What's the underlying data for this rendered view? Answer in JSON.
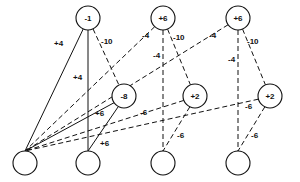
{
  "diagram": {
    "type": "neural-network",
    "nodes": [
      {
        "id": "o1",
        "layer": "output",
        "label": "-1",
        "x": 88,
        "y": 18
      },
      {
        "id": "o2",
        "layer": "output",
        "label": "+6",
        "x": 163,
        "y": 18
      },
      {
        "id": "o3",
        "layer": "output",
        "label": "+6",
        "x": 238,
        "y": 18
      },
      {
        "id": "h1",
        "layer": "hidden",
        "label": "-8",
        "x": 124,
        "y": 96
      },
      {
        "id": "h2",
        "layer": "hidden",
        "label": "+2",
        "x": 195,
        "y": 96
      },
      {
        "id": "h3",
        "layer": "hidden",
        "label": "+2",
        "x": 270,
        "y": 96
      },
      {
        "id": "i1",
        "layer": "input",
        "label": "",
        "x": 25,
        "y": 163
      },
      {
        "id": "i2",
        "layer": "input",
        "label": "",
        "x": 88,
        "y": 163
      },
      {
        "id": "i3",
        "layer": "input",
        "label": "",
        "x": 163,
        "y": 163
      },
      {
        "id": "i4",
        "layer": "input",
        "label": "",
        "x": 238,
        "y": 163
      }
    ],
    "edges": [
      {
        "from": "o1",
        "to": "i1",
        "weight": "+4",
        "style": "solid",
        "lx": 54,
        "ly": 46
      },
      {
        "from": "o1",
        "to": "i2",
        "weight": "+4",
        "style": "solid",
        "lx": 73,
        "ly": 80
      },
      {
        "from": "o1",
        "to": "h1",
        "weight": "-10",
        "style": "dashed",
        "lx": 101,
        "ly": 44
      },
      {
        "from": "o2",
        "to": "i1",
        "weight": "-4",
        "style": "dashed",
        "lx": 142,
        "ly": 38
      },
      {
        "from": "o2",
        "to": "i3",
        "weight": "-4",
        "style": "dashed",
        "lx": 153,
        "ly": 58
      },
      {
        "from": "o2",
        "to": "h2",
        "weight": "-10",
        "style": "dashed",
        "lx": 173,
        "ly": 40
      },
      {
        "from": "o3",
        "to": "i1",
        "weight": "-4",
        "style": "dashed",
        "lx": 209,
        "ly": 38
      },
      {
        "from": "o3",
        "to": "i4",
        "weight": "-4",
        "style": "dashed",
        "lx": 228,
        "ly": 62
      },
      {
        "from": "o3",
        "to": "h3",
        "weight": "-10",
        "style": "dashed",
        "lx": 247,
        "ly": 44
      },
      {
        "from": "h1",
        "to": "i1",
        "weight": "+6",
        "style": "solid",
        "lx": 95,
        "ly": 116
      },
      {
        "from": "h1",
        "to": "i2",
        "weight": "+6",
        "style": "solid",
        "lx": 100,
        "ly": 146
      },
      {
        "from": "h2",
        "to": "i1",
        "weight": "-6",
        "style": "dashed",
        "lx": 140,
        "ly": 115
      },
      {
        "from": "h2",
        "to": "i3",
        "weight": "-6",
        "style": "dashed",
        "lx": 177,
        "ly": 138
      },
      {
        "from": "h3",
        "to": "i1",
        "weight": "-6",
        "style": "dashed",
        "lx": 245,
        "ly": 109
      },
      {
        "from": "h3",
        "to": "i4",
        "weight": "-6",
        "style": "dashed",
        "lx": 251,
        "ly": 138
      }
    ],
    "node_radius": 12,
    "colors": {
      "stroke": "#111111",
      "background": "#ffffff"
    }
  }
}
